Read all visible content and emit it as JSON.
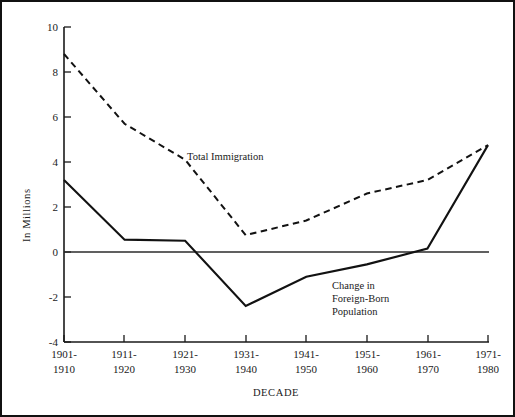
{
  "chart_data": {
    "type": "line",
    "title": "",
    "xlabel": "DECADE",
    "ylabel": "In Millions",
    "ylim": [
      -4,
      10
    ],
    "yticks": [
      -4,
      -2,
      0,
      2,
      4,
      6,
      8,
      10
    ],
    "ytick_labels": [
      "-4",
      "-2",
      "0",
      "2",
      "4",
      "6",
      "8",
      "10"
    ],
    "grid": false,
    "legend": "inline-annotations",
    "categories": [
      "1901-\n1910",
      "1911-\n1920",
      "1921-\n1930",
      "1931-\n1940",
      "1941-\n1950",
      "1951-\n1960",
      "1961-\n1970",
      "1971-\n1980"
    ],
    "category_lines": [
      [
        "1901-",
        "1910"
      ],
      [
        "1911-",
        "1920"
      ],
      [
        "1921-",
        "1930"
      ],
      [
        "1931-",
        "1940"
      ],
      [
        "1941-",
        "1950"
      ],
      [
        "1951-",
        "1960"
      ],
      [
        "1961-",
        "1970"
      ],
      [
        "1971-",
        "1980"
      ]
    ],
    "series": [
      {
        "name": "Total Immigration",
        "style": "dashed",
        "label_lines": [
          "Total Immigration"
        ],
        "values": [
          8.8,
          5.7,
          4.1,
          0.75,
          1.4,
          2.6,
          3.2,
          4.75
        ]
      },
      {
        "name": "Change in Foreign-Born Population",
        "style": "solid",
        "label_lines": [
          "Change in",
          "Foreign-Born",
          "Population"
        ],
        "values": [
          3.2,
          0.55,
          0.5,
          -2.4,
          -1.1,
          -0.55,
          0.15,
          4.75
        ]
      }
    ],
    "zero_reference_line": 0
  }
}
